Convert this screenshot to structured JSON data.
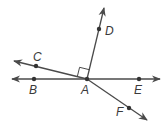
{
  "diagram": {
    "colors": {
      "line": "#4a4a4a",
      "point": "#333333",
      "label": "#3a3a3a",
      "background": "#ffffff"
    },
    "vertex": {
      "label": "A",
      "x": 87,
      "y": 79
    },
    "points": [
      {
        "label": "B",
        "x": 34,
        "y": 79,
        "label_x": 30,
        "label_y": 94
      },
      {
        "label": "C",
        "x": 36,
        "y": 66,
        "label_x": 33,
        "label_y": 61
      },
      {
        "label": "D",
        "x": 99,
        "y": 29,
        "label_x": 105,
        "label_y": 35
      },
      {
        "label": "E",
        "x": 139,
        "y": 79,
        "label_x": 135,
        "label_y": 94
      },
      {
        "label": "F",
        "x": 129,
        "y": 108,
        "label_x": 116,
        "label_y": 115
      }
    ],
    "rays": [
      {
        "name": "ray-AB",
        "to_x": 12,
        "to_y": 79
      },
      {
        "name": "ray-AE",
        "to_x": 160,
        "to_y": 79
      },
      {
        "name": "ray-AC",
        "to_x": 14,
        "to_y": 61
      },
      {
        "name": "ray-AD",
        "to_x": 104,
        "to_y": 8
      },
      {
        "name": "ray-AF",
        "to_x": 147,
        "to_y": 120
      }
    ],
    "right_angle_marker": {
      "between": [
        "C",
        "D"
      ],
      "at": "A"
    },
    "labels": {
      "A": "A",
      "B": "B",
      "C": "C",
      "D": "D",
      "E": "E",
      "F": "F"
    }
  }
}
